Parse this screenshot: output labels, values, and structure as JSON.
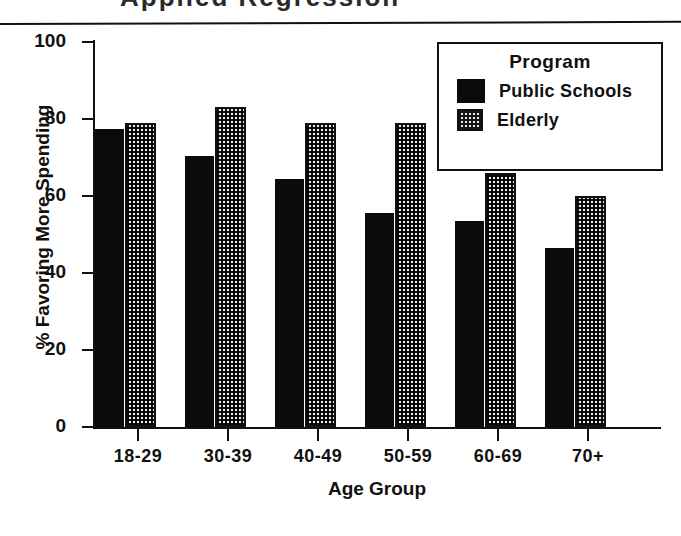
{
  "page": {
    "title_remnant": "Applied Regression",
    "rule": "horizontal-rule"
  },
  "chart_data": {
    "type": "bar",
    "title": "",
    "subtitle": "",
    "xlabel": "Age Group",
    "ylabel": "% Favoring More Spending",
    "categories": [
      "18-29",
      "30-39",
      "40-49",
      "50-59",
      "60-69",
      "70+"
    ],
    "series": [
      {
        "name": "Public Schools",
        "pattern": "solid",
        "color": "#0b0b0b",
        "values": [
          77,
          70,
          64,
          55,
          53,
          46
        ]
      },
      {
        "name": "Elderly",
        "pattern": "dotted",
        "color": "#e9e9e9",
        "values": [
          78,
          82,
          78,
          78,
          65,
          59
        ]
      }
    ],
    "ylim": [
      0,
      100
    ],
    "yticks": [
      0,
      20,
      40,
      60,
      80,
      100
    ],
    "ytick_labels": [
      "0",
      "20",
      "40",
      "60",
      "80",
      "100"
    ],
    "grid": false,
    "legend": {
      "position": "top-right",
      "title": "Program"
    }
  }
}
